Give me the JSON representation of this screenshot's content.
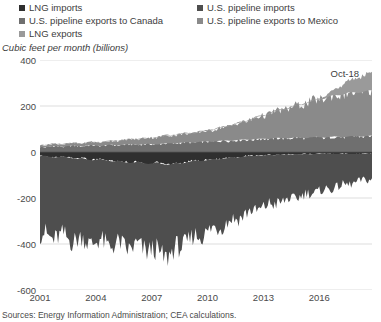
{
  "legend": {
    "items": [
      {
        "label": "LNG imports",
        "color": "#2f2f2f",
        "swatch": "legend-swatch"
      },
      {
        "label": "U.S. pipeline exports to Canada",
        "color": "#6f6f6f",
        "swatch": "legend-swatch"
      },
      {
        "label": "LNG exports",
        "color": "#9a9a9a",
        "swatch": "legend-swatch"
      },
      {
        "label": "U.S. pipeline imports",
        "color": "#4e4e4e",
        "swatch": "legend-swatch"
      },
      {
        "label": "U.S. pipeline exports to Mexico",
        "color": "#8a8a8a",
        "swatch": "legend-swatch"
      }
    ]
  },
  "axis_title": "Cubic feet per month (billions)",
  "annotation": {
    "text": "Oct-18"
  },
  "source": "Sources: Energy Information Administration; CEA calculations.",
  "chart_data": {
    "type": "area",
    "title": "",
    "subtitle": "",
    "xlabel": "",
    "ylabel": "Cubic feet per month (billions)",
    "stacked": true,
    "grid": true,
    "legend_position": "top",
    "xlim": [
      2001.0,
      2018.83
    ],
    "ylim": [
      -600,
      400
    ],
    "yticks": [
      400,
      200,
      0,
      -200,
      -400,
      -600
    ],
    "ytick_labels": [
      "400",
      "200",
      "0",
      "-200",
      "-400",
      "-600"
    ],
    "xticks": [
      2001,
      2004,
      2007,
      2010,
      2013,
      2016
    ],
    "xtick_labels": [
      "2001",
      "2004",
      "2007",
      "2010",
      "2013",
      "2016"
    ],
    "annotations": [
      {
        "text": "Oct-18",
        "x": 2018.0,
        "y": 340
      }
    ],
    "x": [
      2001.0,
      2001.25,
      2001.5,
      2001.75,
      2002.0,
      2002.25,
      2002.5,
      2002.75,
      2003.0,
      2003.25,
      2003.5,
      2003.75,
      2004.0,
      2004.25,
      2004.5,
      2004.75,
      2005.0,
      2005.25,
      2005.5,
      2005.75,
      2006.0,
      2006.25,
      2006.5,
      2006.75,
      2007.0,
      2007.25,
      2007.5,
      2007.75,
      2008.0,
      2008.25,
      2008.5,
      2008.75,
      2009.0,
      2009.25,
      2009.5,
      2009.75,
      2010.0,
      2010.25,
      2010.5,
      2010.75,
      2011.0,
      2011.25,
      2011.5,
      2011.75,
      2012.0,
      2012.25,
      2012.5,
      2012.75,
      2013.0,
      2013.25,
      2013.5,
      2013.75,
      2014.0,
      2014.25,
      2014.5,
      2014.75,
      2015.0,
      2015.25,
      2015.5,
      2015.75,
      2016.0,
      2016.25,
      2016.5,
      2016.75,
      2017.0,
      2017.25,
      2017.5,
      2017.75,
      2018.0,
      2018.25,
      2018.5,
      2018.83
    ],
    "series": [
      {
        "name": "U.S. pipeline exports to Canada",
        "color": "#6f6f6f",
        "sign": "positive",
        "values": [
          22,
          20,
          24,
          26,
          24,
          22,
          26,
          28,
          26,
          24,
          28,
          30,
          28,
          26,
          30,
          32,
          30,
          28,
          32,
          34,
          32,
          30,
          34,
          36,
          34,
          32,
          36,
          38,
          38,
          36,
          40,
          42,
          42,
          40,
          44,
          46,
          46,
          44,
          48,
          50,
          50,
          48,
          52,
          54,
          54,
          52,
          56,
          58,
          58,
          56,
          60,
          62,
          60,
          58,
          62,
          64,
          62,
          60,
          64,
          66,
          64,
          62,
          66,
          68,
          66,
          64,
          68,
          70,
          68,
          66,
          70,
          72
        ]
      },
      {
        "name": "U.S. pipeline exports to Mexico",
        "color": "#8a8a8a",
        "sign": "positive",
        "values": [
          8,
          8,
          9,
          9,
          10,
          10,
          11,
          11,
          12,
          12,
          13,
          14,
          14,
          15,
          16,
          17,
          18,
          19,
          21,
          22,
          23,
          24,
          26,
          27,
          28,
          30,
          32,
          33,
          34,
          36,
          38,
          39,
          38,
          40,
          43,
          45,
          46,
          50,
          55,
          58,
          60,
          66,
          72,
          75,
          78,
          86,
          94,
          98,
          100,
          108,
          116,
          120,
          122,
          128,
          136,
          140,
          142,
          150,
          158,
          162,
          164,
          170,
          178,
          180,
          180,
          186,
          192,
          190,
          188,
          194,
          198,
          196
        ]
      },
      {
        "name": "LNG exports",
        "color": "#9a9a9a",
        "sign": "positive",
        "values": [
          2,
          2,
          2,
          2,
          2,
          2,
          2,
          2,
          2,
          2,
          2,
          2,
          2,
          2,
          2,
          2,
          2,
          2,
          2,
          2,
          2,
          2,
          2,
          2,
          2,
          2,
          3,
          3,
          3,
          3,
          3,
          3,
          3,
          3,
          3,
          3,
          3,
          3,
          3,
          3,
          3,
          3,
          3,
          3,
          3,
          3,
          3,
          3,
          3,
          3,
          3,
          3,
          3,
          3,
          3,
          3,
          3,
          3,
          3,
          3,
          4,
          10,
          18,
          26,
          34,
          44,
          52,
          58,
          64,
          70,
          76,
          80
        ]
      },
      {
        "name": "LNG imports",
        "color": "#2f2f2f",
        "sign": "negative",
        "values": [
          -18,
          -16,
          -20,
          -24,
          -22,
          -18,
          -24,
          -28,
          -30,
          -26,
          -32,
          -36,
          -34,
          -30,
          -36,
          -40,
          -42,
          -38,
          -44,
          -48,
          -46,
          -42,
          -48,
          -52,
          -50,
          -44,
          -52,
          -56,
          -54,
          -46,
          -50,
          -48,
          -42,
          -36,
          -40,
          -38,
          -34,
          -30,
          -32,
          -30,
          -26,
          -22,
          -24,
          -22,
          -18,
          -16,
          -18,
          -16,
          -14,
          -12,
          -14,
          -12,
          -12,
          -10,
          -12,
          -10,
          -10,
          -8,
          -10,
          -8,
          -8,
          -8,
          -8,
          -8,
          -8,
          -8,
          -8,
          -8,
          -8,
          -8,
          -8,
          -8
        ]
      },
      {
        "name": "U.S. pipeline imports",
        "color": "#4e4e4e",
        "sign": "negative",
        "values": [
          -340,
          -330,
          -350,
          -360,
          -345,
          -335,
          -355,
          -365,
          -350,
          -340,
          -360,
          -370,
          -355,
          -345,
          -365,
          -375,
          -360,
          -350,
          -370,
          -380,
          -365,
          -355,
          -375,
          -385,
          -370,
          -380,
          -400,
          -410,
          -385,
          -360,
          -365,
          -355,
          -340,
          -320,
          -330,
          -325,
          -310,
          -295,
          -300,
          -295,
          -280,
          -265,
          -270,
          -265,
          -250,
          -235,
          -240,
          -235,
          -225,
          -210,
          -215,
          -210,
          -205,
          -190,
          -195,
          -190,
          -180,
          -168,
          -172,
          -168,
          -160,
          -150,
          -155,
          -150,
          -140,
          -130,
          -135,
          -130,
          -120,
          -112,
          -116,
          -110
        ]
      }
    ]
  }
}
